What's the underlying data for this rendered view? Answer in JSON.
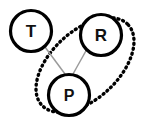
{
  "diagram": {
    "type": "node-link-graph",
    "title": "",
    "canvas": {
      "width": 146,
      "height": 127,
      "background": "#ffffff"
    },
    "colors": {
      "node_stroke": "#000000",
      "node_fill": "#ffffff",
      "label": "#111111",
      "edge": "#9a9a9a",
      "group_outline": "#000000"
    },
    "nodes": [
      {
        "id": "T",
        "label": "T",
        "cx": 31,
        "cy": 31,
        "r": 20.5,
        "stroke_width": 3.2,
        "font_size": 17
      },
      {
        "id": "R",
        "label": "R",
        "cx": 101,
        "cy": 35,
        "r": 20.5,
        "stroke_width": 3.2,
        "font_size": 17
      },
      {
        "id": "P",
        "label": "P",
        "cx": 69,
        "cy": 95,
        "r": 20.5,
        "stroke_width": 3.2,
        "font_size": 16
      }
    ],
    "edges": [
      {
        "id": "edge-t-p",
        "from": "T",
        "to": "P",
        "x1": 45,
        "y1": 47,
        "x2": 65,
        "y2": 74,
        "stroke_width": 1.5
      },
      {
        "id": "edge-r-p",
        "from": "R",
        "to": "P",
        "x1": 87,
        "y1": 49,
        "x2": 73,
        "y2": 74,
        "stroke_width": 1.5
      }
    ],
    "groups": [
      {
        "id": "group-rp",
        "label": "",
        "members": [
          "R",
          "P"
        ],
        "style": "dotted-ellipse",
        "cx": 85,
        "cy": 65,
        "rx": 59,
        "ry": 34,
        "rotation": -43,
        "stroke_width": 3.4,
        "dash": "1 4"
      }
    ]
  }
}
